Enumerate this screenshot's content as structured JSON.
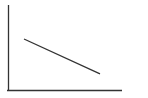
{
  "chart_data": {
    "type": "line",
    "title": "",
    "xlabel": "",
    "ylabel": "",
    "grid": false,
    "legend": null,
    "x": [
      0,
      1
    ],
    "series": [
      {
        "name": "",
        "values": [
          0.6,
          0.19
        ]
      }
    ],
    "xlim": [
      0,
      1
    ],
    "ylim": [
      0,
      1
    ],
    "colors": {
      "axis": "#333333",
      "line": "#333333",
      "background": "#ffffff"
    }
  }
}
